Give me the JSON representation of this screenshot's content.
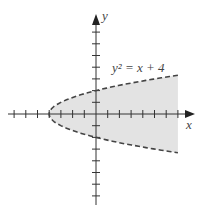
{
  "diagram": {
    "equation_label": "y² = x + 4",
    "x_axis_label": "x",
    "y_axis_label": "y",
    "colors": {
      "shade": "#e3e3e3",
      "axis": "#333333",
      "curve": "#444444"
    },
    "origin_px": [
      96,
      114
    ],
    "unit_px": 11.7,
    "x_ticks": [
      -7,
      -6,
      -5,
      -4,
      -3,
      -2,
      -1,
      1,
      2,
      3,
      4,
      5,
      6,
      7
    ],
    "y_ticks": [
      -7,
      -6,
      -5,
      -4,
      -3,
      -2,
      -1,
      1,
      2,
      3,
      4,
      5,
      6,
      7
    ],
    "region": "x > y² - 4 (shaded, boundary dashed)",
    "x_range_shown": [
      -7,
      7
    ]
  }
}
